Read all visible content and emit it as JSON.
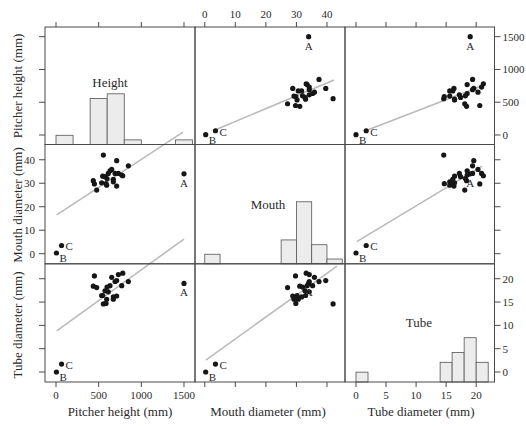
{
  "chart_data": {
    "type": "scatter",
    "subtype": "scatterplot-matrix",
    "title": "",
    "grid": false,
    "variables": [
      {
        "key": "height",
        "name": "Pitcher height (mm)",
        "panel_label": "Height",
        "ticks": [
          0,
          500,
          1000,
          1500
        ],
        "x_domain": [
          -129,
          1629
        ],
        "y_domain": [
          -145,
          1648
        ]
      },
      {
        "key": "mouth",
        "name": "Mouth diameter (mm)",
        "panel_label": "Mouth",
        "ticks": [
          0,
          10,
          20,
          30,
          40
        ],
        "x_domain": [
          -3.2,
          45.9
        ],
        "y_domain": [
          -4.3,
          46.5
        ]
      },
      {
        "key": "tube",
        "name": "Tube diameter (mm)",
        "panel_label": "Tube",
        "ticks": [
          0,
          5,
          10,
          15,
          20
        ],
        "x_domain": [
          -1.83,
          23.05
        ],
        "y_domain": [
          -2.14,
          23.2
        ]
      }
    ],
    "points": [
      {
        "label": "A",
        "height": 1500,
        "mouth": 34.0,
        "tube": 19.0
      },
      {
        "label": "B",
        "height": 5,
        "mouth": 0.3,
        "tube": 0.0
      },
      {
        "label": "C",
        "height": 65,
        "mouth": 3.5,
        "tube": 1.7
      },
      {
        "label": "",
        "height": 555,
        "mouth": 42.0,
        "tube": 14.6
      },
      {
        "label": "",
        "height": 711,
        "mouth": 39.6,
        "tube": 19.6
      },
      {
        "label": "",
        "height": 848,
        "mouth": 37.4,
        "tube": 19.4
      },
      {
        "label": "",
        "height": 437,
        "mouth": 31.1,
        "tube": 18.4
      },
      {
        "label": "",
        "height": 450,
        "mouth": 29.7,
        "tube": 20.6
      },
      {
        "label": "",
        "height": 477,
        "mouth": 27.1,
        "tube": 18.1
      },
      {
        "label": "",
        "height": 535,
        "mouth": 30.2,
        "tube": 16.4
      },
      {
        "label": "",
        "height": 594,
        "mouth": 29.2,
        "tube": 15.6
      },
      {
        "label": "",
        "height": 711,
        "mouth": 28.8,
        "tube": 16.3
      },
      {
        "label": "",
        "height": 574,
        "mouth": 32.8,
        "tube": 17.4
      },
      {
        "label": "",
        "height": 613,
        "mouth": 34.2,
        "tube": 17.2
      },
      {
        "label": "",
        "height": 633,
        "mouth": 35.3,
        "tube": 18.5
      },
      {
        "label": "",
        "height": 653,
        "mouth": 35.9,
        "tube": 20.3
      },
      {
        "label": "",
        "height": 692,
        "mouth": 34.2,
        "tube": 19.4
      },
      {
        "label": "",
        "height": 731,
        "mouth": 34.2,
        "tube": 20.9
      },
      {
        "label": "",
        "height": 770,
        "mouth": 33.5,
        "tube": 18.5
      },
      {
        "label": "",
        "height": 672,
        "mouth": 31.7,
        "tube": 16.1
      },
      {
        "label": "",
        "height": 672,
        "mouth": 30.6,
        "tube": 15.6
      },
      {
        "label": "",
        "height": 586,
        "mouth": 29.8,
        "tube": 14.7
      },
      {
        "label": "",
        "height": 782,
        "mouth": 33.2,
        "tube": 21.2
      },
      {
        "label": "",
        "height": 547,
        "mouth": 33.0,
        "tube": 16.4
      },
      {
        "label": "",
        "height": 598,
        "mouth": 32.0,
        "tube": 18.2
      }
    ],
    "histograms": [
      {
        "variable": "height",
        "ymax": 25.5,
        "bins": [
          [
            0,
            200
          ],
          [
            400,
            600
          ],
          [
            600,
            800
          ],
          [
            800,
            1000
          ],
          [
            1400,
            1600
          ]
        ],
        "counts": [
          2,
          10,
          11,
          1,
          1
        ]
      },
      {
        "variable": "mouth",
        "ymax": 25,
        "bins": [
          [
            0,
            5
          ],
          [
            25,
            30
          ],
          [
            30,
            35
          ],
          [
            35,
            40
          ],
          [
            40,
            45
          ]
        ],
        "counts": [
          2,
          5,
          13,
          4,
          1
        ]
      },
      {
        "variable": "tube",
        "ymax": 24,
        "bins": [
          [
            0,
            2
          ],
          [
            14,
            16
          ],
          [
            16,
            18
          ],
          [
            18,
            20
          ],
          [
            20,
            22
          ]
        ],
        "counts": [
          2,
          4,
          6,
          9,
          4
        ]
      }
    ],
    "fit_lines": [
      {
        "x": "mouth",
        "y": "height",
        "from": [
          3.37,
          76
        ],
        "to": [
          42.3,
          839
        ]
      },
      {
        "x": "tube",
        "y": "height",
        "from": [
          1.5,
          61
        ],
        "to": [
          21.33,
          763
        ]
      },
      {
        "x": "height",
        "y": "mouth",
        "from": [
          8,
          16.5
        ],
        "to": [
          1488,
          51.8
        ]
      },
      {
        "x": "tube",
        "y": "mouth",
        "from": [
          0.12,
          5.1
        ],
        "to": [
          21.0,
          37.3
        ]
      },
      {
        "x": "height",
        "y": "tube",
        "from": [
          8,
          8.8
        ],
        "to": [
          1500,
          28.5
        ]
      },
      {
        "x": "mouth",
        "y": "tube",
        "from": [
          0.33,
          2.57
        ],
        "to": [
          43.3,
          22.7
        ]
      }
    ],
    "tick_label_sides": {
      "columns": [
        "bottom",
        "top",
        "bottom"
      ],
      "rows": [
        "right",
        "left",
        "right"
      ]
    }
  }
}
